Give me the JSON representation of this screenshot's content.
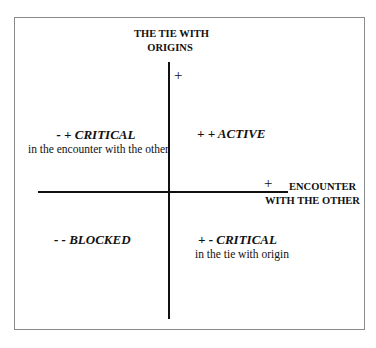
{
  "diagram": {
    "vertical_axis": {
      "label_line1": "THE TIE WITH",
      "label_line2": "ORIGINS",
      "positive_marker": "+"
    },
    "horizontal_axis": {
      "label_line1": "ENCOUNTER",
      "label_line2": "WITH THE OTHER",
      "positive_marker": "+"
    },
    "quadrants": {
      "top_left": {
        "signs": "- +",
        "title": "CRITICAL",
        "subtitle": "in the encounter with the other"
      },
      "top_right": {
        "signs": "+ +",
        "title": "ACTIVE",
        "subtitle": ""
      },
      "bottom_left": {
        "signs": "- -",
        "title": "BLOCKED",
        "subtitle": ""
      },
      "bottom_right": {
        "signs": "+ -",
        "title": "CRITICAL",
        "subtitle": "in the tie with origin"
      }
    }
  }
}
